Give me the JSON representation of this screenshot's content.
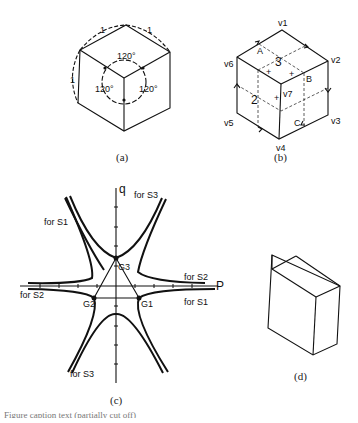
{
  "figure": {
    "panel_a": {
      "caption": "(a)",
      "edge_labels": [
        "1",
        "1",
        "1"
      ],
      "angle_labels": [
        "120°",
        "120°",
        "120°"
      ]
    },
    "panel_b": {
      "caption": "(b)",
      "vertex_labels": {
        "v1": "v1",
        "v2": "v2",
        "v3": "v3",
        "v4": "v4",
        "v5": "v5",
        "v6": "v6",
        "v7": "v7"
      },
      "point_labels": [
        "A",
        "B",
        "C"
      ],
      "face_labels": [
        "3",
        "2"
      ],
      "plus_marks": [
        "+",
        "+",
        "+",
        "+"
      ]
    },
    "panel_c": {
      "caption": "(c)",
      "axis_labels": {
        "horizontal": "P",
        "vertical": "q"
      },
      "points": [
        "G1",
        "G2",
        "G3"
      ],
      "curve_labels": [
        "for S1",
        "for S2",
        "for S3",
        "for S1",
        "for S2",
        "for S3"
      ]
    },
    "panel_d": {
      "caption": "(d)"
    },
    "footer_text": "Figure caption text (partially cut off)"
  }
}
